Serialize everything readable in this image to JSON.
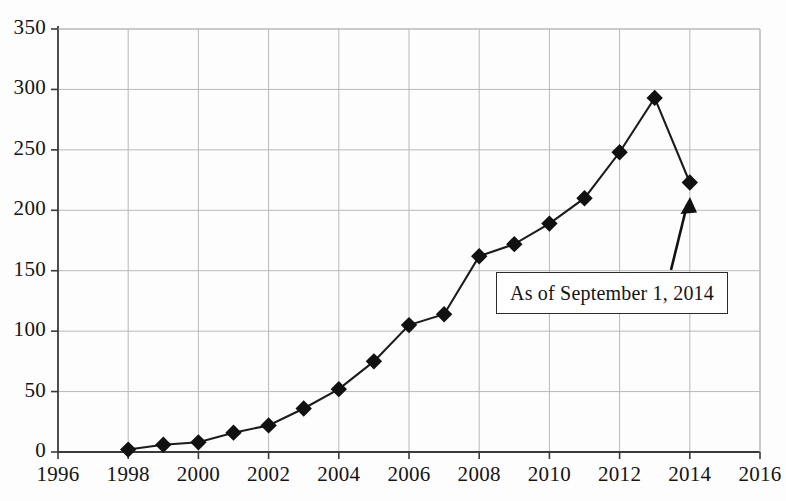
{
  "chart_data": {
    "type": "line",
    "title": "",
    "subtitle": "",
    "xlabel": "",
    "ylabel": "",
    "x": [
      1998,
      1999,
      2000,
      2001,
      2002,
      2003,
      2004,
      2005,
      2006,
      2007,
      2008,
      2009,
      2010,
      2011,
      2012,
      2013,
      2014
    ],
    "values": [
      2,
      6,
      8,
      16,
      22,
      36,
      52,
      75,
      105,
      114,
      162,
      172,
      189,
      210,
      248,
      293,
      223
    ],
    "series": [
      {
        "name": "",
        "values": [
          2,
          6,
          8,
          16,
          22,
          36,
          52,
          75,
          105,
          114,
          162,
          172,
          189,
          210,
          248,
          293,
          223
        ]
      }
    ],
    "xlim": [
      1996,
      2016
    ],
    "ylim": [
      0,
      350
    ],
    "xticks": [
      1996,
      1998,
      2000,
      2002,
      2004,
      2006,
      2008,
      2010,
      2012,
      2014,
      2016
    ],
    "xtick_labels": [
      "1996",
      "1998",
      "2000",
      "2002",
      "2004",
      "2006",
      "2008",
      "2010",
      "2012",
      "2014",
      "2016"
    ],
    "yticks": [
      0,
      50,
      100,
      150,
      200,
      250,
      300,
      350
    ],
    "ytick_labels": [
      "0",
      "50",
      "100",
      "150",
      "200",
      "250",
      "300",
      "350"
    ],
    "grid": true,
    "grid_color": "#b9b9b9",
    "legend": null,
    "marker": "diamond",
    "marker_color": "#111111",
    "line_color": "#1c1c1c",
    "annotations": [
      {
        "text": "As of September 1, 2014",
        "type": "boxed-label-with-arrow",
        "points_to_x": 2014,
        "points_to_y": 223
      }
    ]
  },
  "annotation": {
    "label": "As of September 1, 2014"
  },
  "axes": {
    "y_labels": [
      "350",
      "300",
      "250",
      "200",
      "150",
      "100",
      "50",
      "0"
    ],
    "x_labels": [
      "1996",
      "1998",
      "2000",
      "2002",
      "2004",
      "2006",
      "2008",
      "2010",
      "2012",
      "2014",
      "2016"
    ]
  }
}
